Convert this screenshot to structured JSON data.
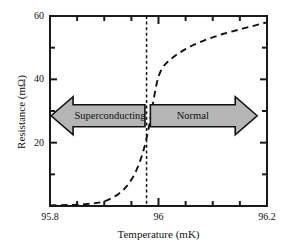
{
  "chart_data": {
    "type": "line",
    "title": "",
    "xlabel": "Temperature (mK)",
    "ylabel": "Resistance (mΩ)",
    "xlim": [
      95.8,
      96.2
    ],
    "ylim": [
      0,
      60
    ],
    "xticks": [
      "95.8",
      "96",
      "96.2"
    ],
    "xtick_values": [
      95.8,
      96.0,
      96.2
    ],
    "xminor_step": 0.05,
    "yticks": [
      "20",
      "40",
      "60"
    ],
    "ytick_values": [
      20,
      40,
      60
    ],
    "yminor_step": 10,
    "grid": false,
    "legend": "none",
    "series": [
      {
        "name": "Resistance",
        "style": "dashed",
        "color": "#111111",
        "x": [
          95.8,
          95.83,
          95.86,
          95.88,
          95.895,
          95.905,
          95.915,
          95.925,
          95.935,
          95.945,
          95.952,
          95.958,
          95.964,
          95.97,
          95.975,
          95.98,
          95.984,
          95.987,
          95.99,
          95.993,
          95.996,
          96.0,
          96.005,
          96.01,
          96.016,
          96.024,
          96.034,
          96.048,
          96.066,
          96.09,
          96.12,
          96.155,
          96.2
        ],
        "y": [
          0.2,
          0.3,
          0.5,
          0.8,
          1.2,
          1.8,
          2.6,
          3.6,
          5.0,
          7.0,
          8.8,
          10.8,
          13.2,
          16.2,
          19.2,
          23.0,
          26.5,
          29.5,
          32.5,
          35.5,
          38.2,
          41.0,
          43.0,
          44.3,
          45.4,
          46.6,
          47.9,
          49.4,
          51.0,
          52.7,
          54.4,
          56.0,
          58.0
        ]
      }
    ],
    "transition_line": {
      "label": "critical temperature",
      "x": 95.978,
      "style": "dashed",
      "color": "#111111"
    },
    "annotations": [
      {
        "name": "superconducting-arrow",
        "label": "Superconducting",
        "direction": "left",
        "fill": "#b5b5b5",
        "stroke": "#111111",
        "x_start": 95.802,
        "x_end": 95.975,
        "y_center": 28.5
      },
      {
        "name": "normal-arrow",
        "label": "Normal",
        "direction": "right",
        "fill": "#b5b5b5",
        "stroke": "#111111",
        "x_start": 95.985,
        "x_end": 96.182,
        "y_center": 28.5
      }
    ]
  },
  "axes": {
    "x_title": "Temperature (mK)",
    "y_title": "Resistance (mΩ)",
    "x_tick_labels": [
      "95.8",
      "96",
      "96.2"
    ],
    "y_tick_labels": [
      "60",
      "40",
      "20"
    ]
  },
  "arrows": {
    "left_label": "Superconducting",
    "right_label": "Normal"
  },
  "colors": {
    "frame": "#1a1a1a",
    "curve": "#111111",
    "arrow_fill": "#b5b5b5",
    "arrow_stroke": "#111111",
    "background": "#ffffff"
  }
}
